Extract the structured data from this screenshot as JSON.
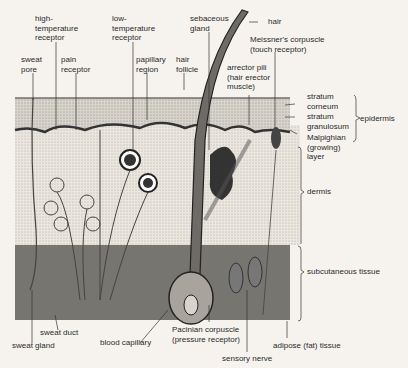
{
  "colors": {
    "background": "#f6f3ee",
    "ink": "#2a2a2a",
    "epidermis_fill": "#d8d4cc",
    "dermis_fill": "#ebe7df",
    "subcutaneous_fill": "#8d8a84",
    "hair_fill": "#6e6b66"
  },
  "labels": {
    "high_temp": "high-\ntemperature\nreceptor",
    "low_temp": "low-\ntemperature\nreceptor",
    "sebaceous": "sebaceous\ngland",
    "hair": "hair",
    "meissner": "Meissner's corpuscle\n(touch receptor)",
    "sweat_pore": "sweat\npore",
    "pain": "pain\nreceptor",
    "papillary": "papillary\nregion",
    "hair_follicle": "hair\nfollicle",
    "arrector": "arrector pili\n(hair erector\nmuscle)",
    "stratum_corneum": "stratum\ncorneum",
    "stratum_granulosum": "stratum\ngranulosum",
    "malpighian": "Malpighian\n(growing)\nlayer",
    "epidermis": "epidermis",
    "dermis": "dermis",
    "subcutaneous": "subcutaneous tissue",
    "sweat_duct": "sweat duct",
    "sweat_gland": "sweat gland",
    "blood_capillary": "blood capillary",
    "pacinian": "Pacinian corpuscle\n(pressure receptor)",
    "sensory_nerve": "sensory nerve",
    "adipose": "adipose (fat) tissue"
  }
}
